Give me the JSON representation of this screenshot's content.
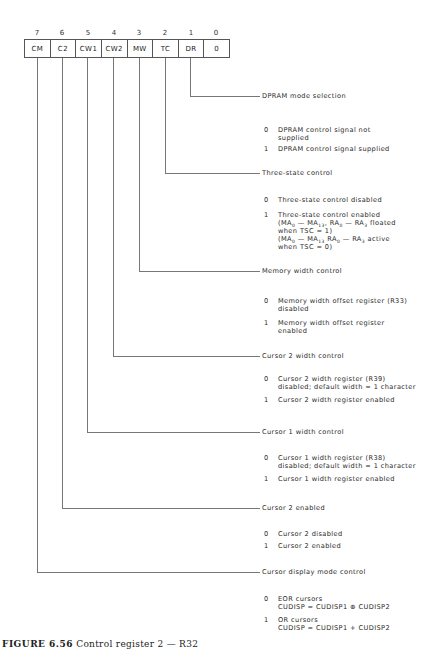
{
  "register": {
    "bit_numbers": [
      "7",
      "6",
      "5",
      "4",
      "3",
      "2",
      "1",
      "0"
    ],
    "fields": [
      "CM",
      "C2",
      "CW1",
      "CW2",
      "MW",
      "TC",
      "DR",
      "0"
    ]
  },
  "sections": [
    {
      "bit": "DR",
      "title": "DPRAM mode selection",
      "options": [
        {
          "value": "0",
          "lines": [
            "DPRAM control signal not",
            "supplied"
          ]
        },
        {
          "value": "1",
          "lines": [
            "DPRAM control signal supplied"
          ]
        }
      ]
    },
    {
      "bit": "TC",
      "title": "Three-state control",
      "options": [
        {
          "value": "0",
          "lines": [
            "Three-state control disabled"
          ]
        },
        {
          "value": "1",
          "lines": [
            "Three-state control enabled",
            "(MA0 — MA13, RA0 — RA3 floated",
            "when TSC = 1)",
            "(MA0 — MA13 RA0 — RA3 active",
            "when TSC = 0)"
          ]
        }
      ]
    },
    {
      "bit": "MW",
      "title": "Memory width control",
      "options": [
        {
          "value": "0",
          "lines": [
            "Memory width offset register (R33)",
            "disabled"
          ]
        },
        {
          "value": "1",
          "lines": [
            "Memory width offset register",
            "enabled"
          ]
        }
      ]
    },
    {
      "bit": "CW2",
      "title": "Cursor 2 width control",
      "options": [
        {
          "value": "0",
          "lines": [
            "Cursor 2 width register (R39)",
            "disabled; default width = 1 character"
          ]
        },
        {
          "value": "1",
          "lines": [
            "Cursor 2 width register enabled"
          ]
        }
      ]
    },
    {
      "bit": "CW1",
      "title": "Cursor 1 width control",
      "options": [
        {
          "value": "0",
          "lines": [
            "Cursor 1 width register (R38)",
            "disabled; default width = 1 character"
          ]
        },
        {
          "value": "1",
          "lines": [
            "Cursor 1 width register enabled"
          ]
        }
      ]
    },
    {
      "bit": "C2",
      "title": "Cursor 2 enabled",
      "options": [
        {
          "value": "0",
          "lines": [
            "Cursor 2 disabled"
          ]
        },
        {
          "value": "1",
          "lines": [
            "Cursor 2 enabled"
          ]
        }
      ]
    },
    {
      "bit": "CM",
      "title": "Cursor display mode control",
      "options": [
        {
          "value": "0",
          "lines": [
            "EOR cursors",
            "CUDISP = CUDISP1 ⊕ CUDISP2"
          ]
        },
        {
          "value": "1",
          "lines": [
            "OR cursors",
            "CUDISP = CUDISP1 + CUDISP2"
          ]
        }
      ]
    }
  ],
  "caption": {
    "figure": "FIGURE 6.56",
    "text": "Control register 2 — R32"
  }
}
